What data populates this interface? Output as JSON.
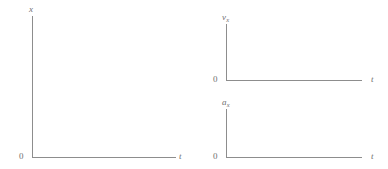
{
  "figure": {
    "background_color": "#ffffff",
    "line_color": "#8d8d8d",
    "label_color": "#6f6f6f"
  },
  "chart_data": [
    {
      "type": "line",
      "title": "",
      "xlabel": "t",
      "ylabel": "x",
      "origin_label": "0",
      "grid": false,
      "legend": null,
      "series": [],
      "x": [],
      "values": [],
      "note": "Empty axes; no data plotted"
    },
    {
      "type": "line",
      "title": "",
      "xlabel": "t",
      "ylabel": "v",
      "ylabel_sub": "x",
      "origin_label": "0",
      "grid": false,
      "legend": null,
      "series": [],
      "x": [],
      "values": [],
      "note": "Empty axes; no data plotted"
    },
    {
      "type": "line",
      "title": "",
      "xlabel": "t",
      "ylabel": "a",
      "ylabel_sub": "x",
      "origin_label": "0",
      "grid": false,
      "legend": null,
      "series": [],
      "x": [],
      "values": [],
      "note": "Empty axes; no data plotted"
    }
  ],
  "plots": {
    "position": {
      "y_axis_label": "x",
      "x_axis_label": "t",
      "origin_label": "0"
    },
    "velocity": {
      "y_axis_label": "v",
      "y_axis_label_sub": "x",
      "x_axis_label": "t",
      "origin_label": "0"
    },
    "acceleration": {
      "y_axis_label": "a",
      "y_axis_label_sub": "x",
      "x_axis_label": "t",
      "origin_label": "0"
    }
  }
}
